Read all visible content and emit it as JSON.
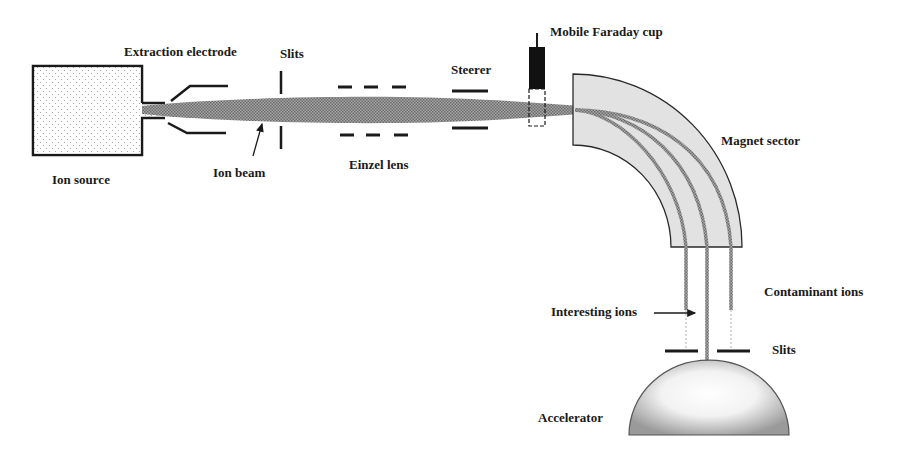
{
  "diagram": {
    "type": "schematic",
    "labels": {
      "ion_source": "Ion source",
      "extraction_electrode": "Extraction electrode",
      "slits_top": "Slits",
      "ion_beam": "Ion beam",
      "einzel_lens": "Einzel lens",
      "steerer": "Steerer",
      "faraday_cup": "Mobile Faraday cup",
      "magnet_sector": "Magnet sector",
      "contaminant_ions": "Contaminant ions",
      "interesting_ions": "Interesting ions",
      "slits_bottom": "Slits",
      "accelerator": "Accelerator"
    },
    "components": [
      {
        "id": "ion-source",
        "label": "Ion source"
      },
      {
        "id": "extraction-electrode",
        "label": "Extraction electrode"
      },
      {
        "id": "slits-1",
        "label": "Slits"
      },
      {
        "id": "einzel-lens",
        "label": "Einzel lens"
      },
      {
        "id": "steerer",
        "label": "Steerer"
      },
      {
        "id": "faraday-cup",
        "label": "Mobile Faraday cup"
      },
      {
        "id": "magnet-sector",
        "label": "Magnet sector"
      },
      {
        "id": "slits-2",
        "label": "Slits"
      },
      {
        "id": "accelerator",
        "label": "Accelerator"
      }
    ],
    "beams": [
      {
        "id": "ion-beam",
        "label": "Ion beam"
      },
      {
        "id": "interesting-ions",
        "label": "Interesting ions"
      },
      {
        "id": "contaminant-ions",
        "label": "Contaminant ions"
      }
    ],
    "colors": {
      "line": "#1a1a1a",
      "magnet_fill": "#e2e2e2",
      "beam": "#8a8a8a",
      "background": "#ffffff"
    }
  }
}
